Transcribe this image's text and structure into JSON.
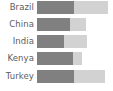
{
  "chart_data": {
    "type": "bar",
    "subtype": "horizontal-stacked",
    "title": "",
    "xlabel": "",
    "ylabel": "",
    "grid": false,
    "legend": "none",
    "orientation": "horizontal",
    "stacked": true,
    "categories": [
      "Brazil",
      "China",
      "India",
      "Kenya",
      "Turkey"
    ],
    "series": [
      {
        "name": "Series 1",
        "color": "#808080",
        "values": [
          52,
          46,
          38,
          50,
          52
        ]
      },
      {
        "name": "Series 2",
        "color": "#d2d2d2",
        "values": [
          46,
          22,
          31,
          12,
          43
        ]
      }
    ],
    "totals": [
      98,
      68,
      69,
      62,
      95
    ],
    "xlim": [
      0,
      104
    ],
    "ylim": null,
    "tick_labels_x": [],
    "annotations": []
  },
  "colors": {
    "background": "#ffffff",
    "label_text": "#5c5c5c",
    "segment_dark": "#808080",
    "segment_light": "#d2d2d2"
  },
  "rows": [
    {
      "label": "Brazil",
      "a": 52,
      "b": 46
    },
    {
      "label": "China",
      "a": 46,
      "b": 22
    },
    {
      "label": "India",
      "a": 38,
      "b": 31
    },
    {
      "label": "Kenya",
      "a": 50,
      "b": 12
    },
    {
      "label": "Turkey",
      "a": 52,
      "b": 43
    }
  ]
}
